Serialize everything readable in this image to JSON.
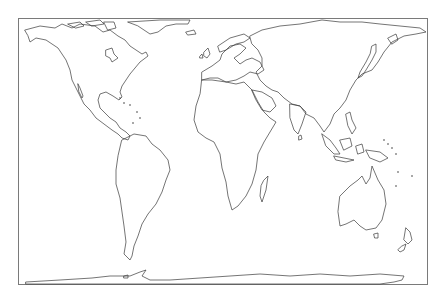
{
  "map": {
    "projection": "equal-area cylindrical (Gall-Peters style) world outline",
    "background_color": "#ffffff",
    "outline_color": "#3a3a3a",
    "frame_color": "#7a7a7a",
    "frame": {
      "x": 18,
      "y": 18,
      "width": 409,
      "height": 266
    },
    "features": [
      {
        "name": "North America",
        "type": "continent"
      },
      {
        "name": "Greenland",
        "type": "island"
      },
      {
        "name": "South America",
        "type": "continent"
      },
      {
        "name": "Europe",
        "type": "continent"
      },
      {
        "name": "Africa",
        "type": "continent"
      },
      {
        "name": "Madagascar",
        "type": "island"
      },
      {
        "name": "Asia",
        "type": "continent"
      },
      {
        "name": "Japan",
        "type": "island-group"
      },
      {
        "name": "Indonesia",
        "type": "island-group"
      },
      {
        "name": "Australia",
        "type": "continent"
      },
      {
        "name": "New Zealand",
        "type": "island-group"
      },
      {
        "name": "Antarctica",
        "type": "continent"
      }
    ]
  }
}
